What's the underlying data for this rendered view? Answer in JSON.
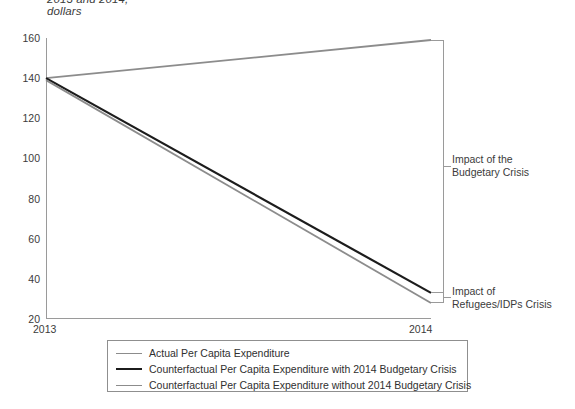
{
  "title": {
    "line1": "2013 and 2014,",
    "line2": "dollars"
  },
  "annotations": {
    "budgetary": {
      "line1": "Impact of the",
      "line2": "Budgetary Crisis"
    },
    "refugees": {
      "line1": "Impact of",
      "line2": "Refugees/IDPs Crisis"
    }
  },
  "legend": {
    "items": [
      {
        "label": "Actual Per Capita Expenditure",
        "color": "#8c8c8c",
        "width": 1.6
      },
      {
        "label": "Counterfactual Per Capita Expenditure with 2014 Budgetary Crisis",
        "color": "#1c1c1c",
        "width": 2.2
      },
      {
        "label": "Counterfactual Per Capita Expenditure without 2014 Budgetary Crisis",
        "color": "#8c8c8c",
        "width": 1.8
      }
    ]
  },
  "chart_data": {
    "type": "line",
    "title": "2013 and 2014, dollars",
    "xlabel": "",
    "ylabel": "",
    "x": [
      "2013",
      "2014"
    ],
    "categories": [
      "2013",
      "2014"
    ],
    "ylim": [
      20,
      160
    ],
    "yticks": [
      20,
      40,
      60,
      80,
      100,
      120,
      140,
      160
    ],
    "ytick_labels": [
      "20",
      "40",
      "60",
      "80",
      "100",
      "120",
      "140",
      "160"
    ],
    "xtick_labels": [
      "2013",
      "2014"
    ],
    "grid": false,
    "legend_position": "bottom",
    "series": [
      {
        "name": "Counterfactual Per Capita Expenditure without 2014 Budgetary Crisis",
        "values": [
          140,
          159
        ],
        "color": "#8c8c8c",
        "width": 1.8
      },
      {
        "name": "Counterfactual Per Capita Expenditure with 2014 Budgetary Crisis",
        "values": [
          140,
          33
        ],
        "color": "#1c1c1c",
        "width": 2.2
      },
      {
        "name": "Actual Per Capita Expenditure",
        "values": [
          139,
          28
        ],
        "color": "#8c8c8c",
        "width": 1.8
      }
    ],
    "annotations": [
      {
        "label": "Impact of the Budgetary Crisis",
        "span": [
          33,
          159
        ]
      },
      {
        "label": "Impact of Refugees/IDPs Crisis",
        "span": [
          28,
          33
        ]
      }
    ]
  }
}
